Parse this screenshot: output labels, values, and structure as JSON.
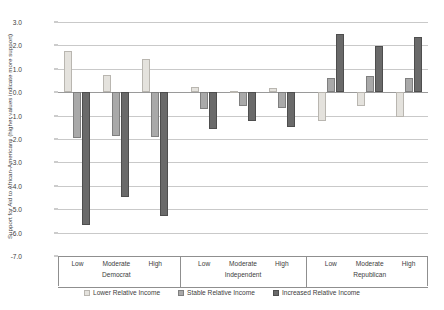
{
  "chart_data": {
    "type": "bar",
    "title": "",
    "xlabel": "",
    "ylabel": "Support for Aid to African-Americans (higher values indicate more support)",
    "ylim": [
      -7.0,
      3.0
    ],
    "ytick_labels": [
      "3.0",
      "2.0",
      "1.0",
      "0.0",
      "-1.0",
      "-2.0",
      "-3.0",
      "-4.0",
      "-5.0",
      "-6.0",
      "-7.0"
    ],
    "ytick_values": [
      3.0,
      2.0,
      1.0,
      0.0,
      -1.0,
      -2.0,
      -3.0,
      -4.0,
      -5.0,
      -6.0,
      -7.0
    ],
    "grid": true,
    "legend_position": "bottom",
    "groups": [
      {
        "name": "Democrat",
        "categories": [
          "Low",
          "Moderate",
          "High"
        ]
      },
      {
        "name": "Independent",
        "categories": [
          "Low",
          "Moderate",
          "High"
        ]
      },
      {
        "name": "Republican",
        "categories": [
          "Low",
          "Moderate",
          "High"
        ]
      }
    ],
    "categories": [
      "Democrat / Low",
      "Democrat / Moderate",
      "Democrat / High",
      "Independent / Low",
      "Independent / Moderate",
      "Independent / High",
      "Republican / Low",
      "Republican / Moderate",
      "Republican / High"
    ],
    "series": [
      {
        "name": "Lower Relative Income",
        "color": "#e4e2dd",
        "values": [
          1.75,
          0.72,
          1.43,
          0.22,
          0.05,
          0.17,
          -1.25,
          -0.58,
          -1.05
        ]
      },
      {
        "name": "Stable Relative Income",
        "color": "#a9a9a9",
        "values": [
          -1.95,
          -1.87,
          -1.93,
          -0.72,
          -0.6,
          -0.67,
          0.6,
          0.68,
          0.62
        ]
      },
      {
        "name": "Increased Relative Income",
        "color": "#6a6a6a",
        "values": [
          -5.68,
          -4.47,
          -5.3,
          -1.57,
          -1.25,
          -1.48,
          2.5,
          1.97,
          2.34
        ]
      }
    ]
  },
  "legend": {
    "items": [
      {
        "label": "Lower Relative Income",
        "swatch": "legend-swatch-lower-relative-income"
      },
      {
        "label": "Stable Relative Income",
        "swatch": "legend-swatch-stable-relative-income"
      },
      {
        "label": "Increased Relative Income",
        "swatch": "legend-swatch-increased-relative-income"
      }
    ]
  }
}
